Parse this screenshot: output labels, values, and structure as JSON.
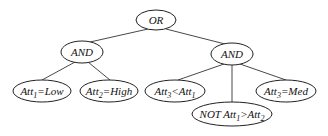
{
  "diagram": {
    "type": "tree",
    "nodes": [
      {
        "id": "or",
        "label": "OR"
      },
      {
        "id": "and1",
        "label": "AND"
      },
      {
        "id": "and2",
        "label": "AND"
      },
      {
        "id": "leaf1",
        "label": "Att1=Low",
        "parts": [
          "Att",
          "1",
          "=Low"
        ]
      },
      {
        "id": "leaf2",
        "label": "Att2=High",
        "parts": [
          "Att",
          "2",
          "=High"
        ]
      },
      {
        "id": "leaf3",
        "label": "Att3<Att1",
        "parts": [
          "Att",
          "3",
          "<Att",
          "1"
        ]
      },
      {
        "id": "leaf4",
        "label": "NOT Att1>Att2",
        "parts": [
          "NOT Att",
          "1",
          ">Att",
          "2"
        ]
      },
      {
        "id": "leaf5",
        "label": "Att3=Med",
        "parts": [
          "Att",
          "3",
          "=Med"
        ]
      }
    ],
    "edges": [
      [
        "or",
        "and1"
      ],
      [
        "or",
        "and2"
      ],
      [
        "and1",
        "leaf1"
      ],
      [
        "and1",
        "leaf2"
      ],
      [
        "and2",
        "leaf3"
      ],
      [
        "and2",
        "leaf4"
      ],
      [
        "and2",
        "leaf5"
      ]
    ]
  }
}
